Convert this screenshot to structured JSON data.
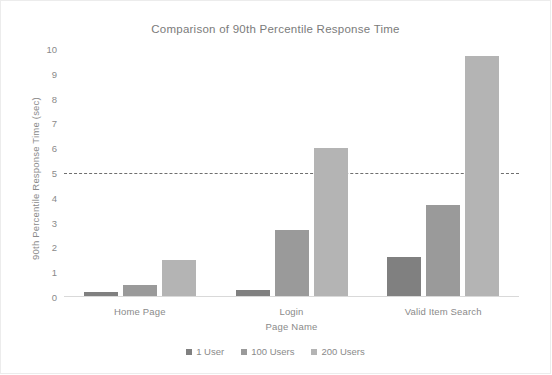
{
  "chart_data": {
    "type": "bar",
    "title": "Comparison of 90th Percentile Response Time",
    "xlabel": "Page Name",
    "ylabel": "90th Percentile Response Time (sec)",
    "categories": [
      "Home Page",
      "Login",
      "Valid Item Search"
    ],
    "series": [
      {
        "name": "1 User",
        "color": "#808080",
        "values": [
          0.2,
          0.3,
          1.6
        ]
      },
      {
        "name": "100 Users",
        "color": "#9a9a9a",
        "values": [
          0.5,
          2.7,
          3.7
        ]
      },
      {
        "name": "200 Users",
        "color": "#b4b4b4",
        "values": [
          1.5,
          6.0,
          9.7
        ]
      }
    ],
    "ylim": [
      0,
      10
    ],
    "yticks": [
      0,
      1,
      2,
      3,
      4,
      5,
      6,
      7,
      8,
      9,
      10
    ],
    "ytick_labels": [
      "0",
      "1",
      "2",
      "3",
      "4",
      "5",
      "6",
      "7",
      "8",
      "9",
      "10"
    ],
    "grid": false,
    "legend_position": "bottom",
    "annotations": [
      {
        "name": "threshold-line",
        "type": "horizontal-dashed-line",
        "value": 5,
        "color": "#6f6f6f"
      }
    ]
  }
}
